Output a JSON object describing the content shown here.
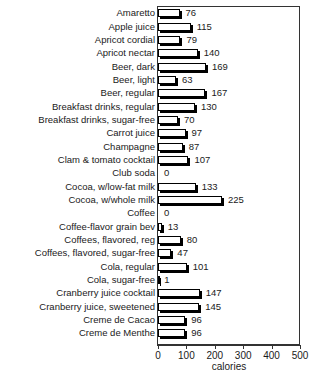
{
  "chart_data": {
    "type": "bar",
    "orientation": "horizontal",
    "title": "",
    "xlabel": "calories",
    "ylabel": "",
    "xlim": [
      0,
      500
    ],
    "xticks": [
      0,
      100,
      200,
      300,
      400,
      500
    ],
    "grid": false,
    "legend": null,
    "categories": [
      "Amaretto",
      "Apple juice",
      "Apricot cordial",
      "Apricot nectar",
      "Beer, dark",
      "Beer, light",
      "Beer, regular",
      "Breakfast drinks, regular",
      "Breakfast drinks, sugar-free",
      "Carrot juice",
      "Champagne",
      "Clam & tomato cocktail",
      "Club soda",
      "Cocoa, w/low-fat milk",
      "Cocoa, w/whole milk",
      "Coffee",
      "Coffee-flavor grain bev",
      "Coffees, flavored, reg",
      "Coffees, flavored, sugar-free",
      "Cola, regular",
      "Cola, sugar-free",
      "Cranberry juice cocktail",
      "Cranberry juice, sweetened",
      "Creme de Cacao",
      "Creme de Menthe"
    ],
    "values": [
      76,
      115,
      79,
      140,
      169,
      63,
      167,
      130,
      70,
      97,
      87,
      107,
      0,
      133,
      225,
      0,
      13,
      80,
      47,
      101,
      1,
      147,
      145,
      96,
      96
    ],
    "value_labels": [
      "76",
      "115",
      "79",
      "140",
      "169",
      "63",
      "167",
      "130",
      "70",
      "97",
      "87",
      "107",
      "0",
      "133",
      "225",
      "0",
      "13",
      "80",
      "47",
      "101",
      "1",
      "147",
      "145",
      "96",
      "96"
    ]
  },
  "style": {
    "bar_face": "#ffffff",
    "bar_edge": "#000000",
    "bar_shadow": "#000000",
    "axis_color": "#333333",
    "text_color": "#1a1a1a"
  }
}
